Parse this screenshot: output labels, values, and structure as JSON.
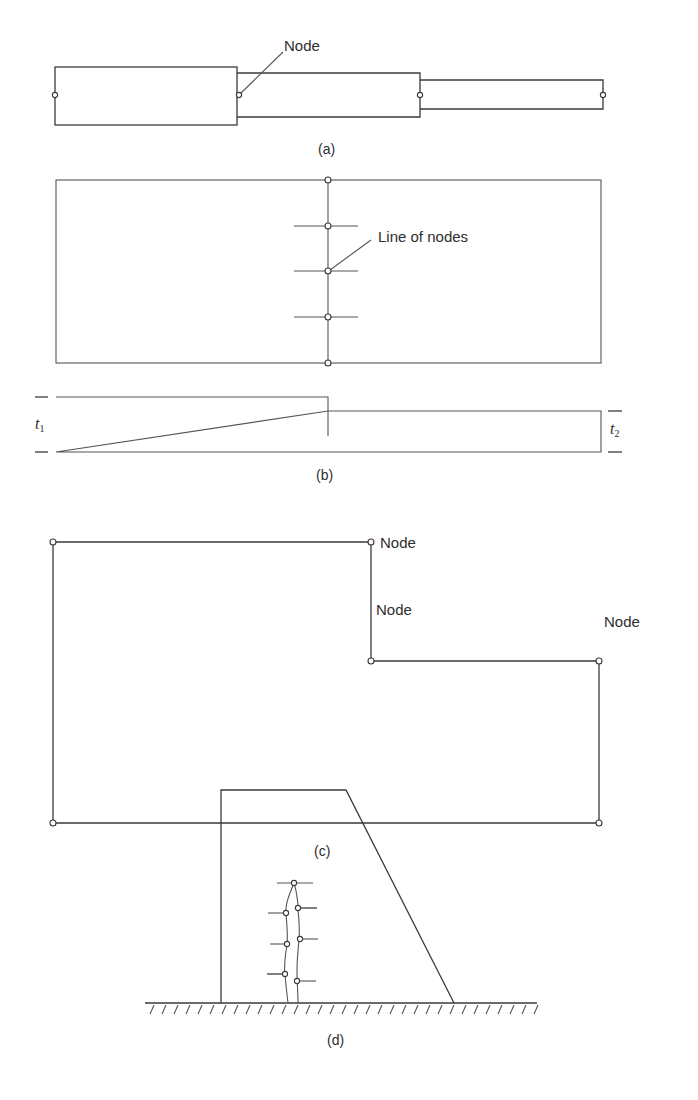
{
  "figure": {
    "panels": [
      {
        "id": "a",
        "caption": "(a)",
        "description": "Stepped bar of three segments with nodes at ends and junctions",
        "labels": {
          "node": "Node"
        },
        "segments": [
          {
            "x1": 55,
            "x2": 237,
            "y_top": 67,
            "y_bot": 125
          },
          {
            "x1": 237,
            "x2": 420,
            "y_top": 73,
            "y_bot": 117
          },
          {
            "x1": 420,
            "x2": 603,
            "y_top": 80,
            "y_bot": 109
          }
        ],
        "nodes": [
          [
            55,
            95
          ],
          [
            239,
            95
          ],
          [
            420,
            95
          ],
          [
            603,
            95
          ]
        ]
      },
      {
        "id": "b",
        "caption": "(b)",
        "description": "Plate with a line of nodes at thickness change; side view shows thicknesses t1 and t2",
        "labels": {
          "line_of_nodes": "Line of nodes",
          "t1": "t",
          "t1_sub": "1",
          "t2": "t",
          "t2_sub": "2"
        },
        "nodes": [
          [
            328,
            180
          ],
          [
            328,
            226
          ],
          [
            328,
            271
          ],
          [
            328,
            317
          ],
          [
            328,
            363
          ]
        ]
      },
      {
        "id": "c",
        "caption": "(c)",
        "description": "L-shaped region with nodes at corners, including re-entrant corner",
        "labels": {
          "node_top": "Node",
          "node_reentrant": "Node",
          "node_right": "Node"
        },
        "nodes": [
          [
            53,
            542
          ],
          [
            371,
            542
          ],
          [
            371,
            661
          ],
          [
            599,
            661
          ],
          [
            599,
            823
          ],
          [
            53,
            823
          ]
        ]
      },
      {
        "id": "d",
        "caption": "(d)",
        "description": "Dam cross-section on ground with line of nodes along a crack"
      }
    ]
  }
}
